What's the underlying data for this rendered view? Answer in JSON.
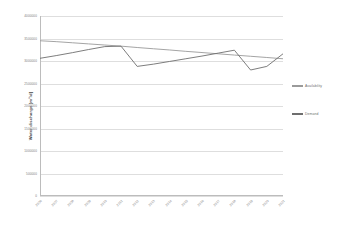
{
  "chart_data": {
    "type": "line",
    "title": "",
    "xlabel": "",
    "ylabel": "Water discharge [m³/d]",
    "ylim": [
      0,
      4000000
    ],
    "grid": true,
    "legend_position": "right",
    "categories": [
      "2006",
      "2007",
      "2008",
      "2009",
      "2010",
      "2011",
      "2012",
      "2013",
      "2014",
      "2015",
      "2016",
      "2017",
      "2018",
      "2019",
      "2020",
      "2021"
    ],
    "ytick_labels": [
      "0",
      "500000",
      "1000000",
      "1500000",
      "2000000",
      "2500000",
      "3000000",
      "3500000",
      "4000000"
    ],
    "ytick_values": [
      0,
      500000,
      1000000,
      1500000,
      2000000,
      2500000,
      3000000,
      3500000,
      4000000
    ],
    "series": [
      {
        "name": "Availability",
        "color": "#9a9a9a",
        "values": [
          3450000,
          3430000,
          3405000,
          3380000,
          3355000,
          3330000,
          3300000,
          3272000,
          3245000,
          3215000,
          3188000,
          3160000,
          3132000,
          3105000,
          3078000,
          3050000
        ]
      },
      {
        "name": "Demand",
        "color": "#6e6e6e",
        "values": [
          3060000,
          3120000,
          3185000,
          3255000,
          3320000,
          3330000,
          2880000,
          2930000,
          2990000,
          3050000,
          3110000,
          3175000,
          3240000,
          2800000,
          2880000,
          3160000
        ]
      }
    ]
  },
  "legend": {
    "items": [
      {
        "label": "Availability",
        "color": "#9a9a9a"
      },
      {
        "label": "Demand",
        "color": "#6e6e6e"
      }
    ]
  }
}
